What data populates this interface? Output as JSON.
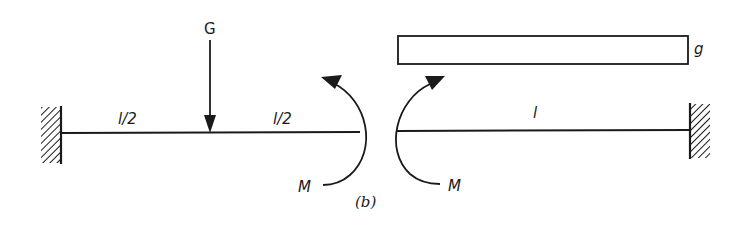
{
  "figure": {
    "caption": "(b)",
    "colors": {
      "ink": "#1a1a1a",
      "background": "#ffffff"
    }
  },
  "left_beam": {
    "support": "fixed-wall-left",
    "segment_labels": [
      "l/2",
      "l/2"
    ],
    "point_load": {
      "label": "G",
      "position": "midspan",
      "direction": "down"
    },
    "end_moment": {
      "label": "M",
      "direction": "counterclockwise"
    }
  },
  "right_beam": {
    "support": "fixed-wall-right",
    "length_label": "l",
    "distributed_load": {
      "label": "g",
      "type": "uniform"
    },
    "end_moment": {
      "label": "M",
      "direction": "clockwise"
    }
  }
}
